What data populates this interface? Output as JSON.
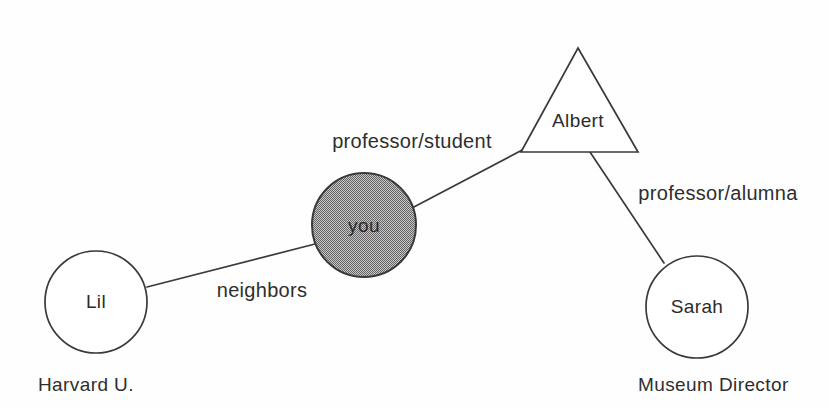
{
  "diagram": {
    "background_color": "#fefefe",
    "stroke_color": "#3a3a3a",
    "text_color": "#2e2e2e",
    "shaded_fill_color": "#a0a0a0",
    "nodes": [
      {
        "id": "lil",
        "label": "Lil",
        "shape": "circle",
        "fill": "white",
        "cx": 96,
        "cy": 302,
        "r": 51
      },
      {
        "id": "you",
        "label": "you",
        "shape": "circle",
        "fill": "shaded",
        "cx": 364,
        "cy": 225,
        "r": 52
      },
      {
        "id": "albert",
        "label": "Albert",
        "shape": "triangle",
        "fill": "white",
        "apex_x": 578,
        "apex_y": 48,
        "base_left_x": 521,
        "base_right_x": 638,
        "base_y": 152,
        "label_x": 578,
        "label_y": 122
      },
      {
        "id": "sarah",
        "label": "Sarah",
        "shape": "circle",
        "fill": "white",
        "cx": 697,
        "cy": 307,
        "r": 51
      }
    ],
    "edges": [
      {
        "id": "lil-you",
        "from": "lil",
        "to": "you",
        "label": "neighbors",
        "x1": 147,
        "y1": 287,
        "x2": 315,
        "y2": 244,
        "label_x": 262,
        "label_y": 292
      },
      {
        "id": "you-albert",
        "from": "you",
        "to": "albert",
        "label": "professor/student",
        "x1": 412,
        "y1": 208,
        "x2": 526,
        "y2": 148,
        "label_x": 412,
        "label_y": 143
      },
      {
        "id": "albert-sarah",
        "from": "albert",
        "to": "sarah",
        "label": "professor/alumna",
        "x1": 590,
        "y1": 152,
        "x2": 664,
        "y2": 263,
        "label_x": 718,
        "label_y": 195
      }
    ],
    "captions": [
      {
        "id": "lil-caption",
        "text": "Harvard U.",
        "for_node": "lil",
        "x": 38,
        "y": 386
      },
      {
        "id": "sarah-caption",
        "text": "Museum Director",
        "for_node": "sarah",
        "x": 638,
        "y": 386
      }
    ]
  }
}
